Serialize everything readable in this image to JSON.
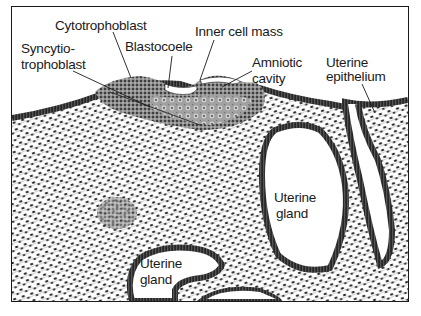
{
  "figure": {
    "labels": {
      "cytotrophoblast": "Cytotrophoblast",
      "blastocoele": "Blastocoele",
      "inner_cell_mass": "Inner cell mass",
      "syncytiotrophoblast_line1": "Syncytio-",
      "syncytiotrophoblast_line2": "trophoblast",
      "amniotic_cavity_line1": "Amniotic",
      "amniotic_cavity_line2": "cavity",
      "uterine_epithelium_line1": "Uterine",
      "uterine_epithelium_line2": "epithelium",
      "uterine_gland_center_line1": "Uterine",
      "uterine_gland_center_line2": "gland",
      "uterine_gland_lower_line1": "Uterine",
      "uterine_gland_lower_line2": "gland"
    },
    "colors": {
      "ink": "#1a1a1a",
      "tissue": "#d9d9d9",
      "epithelium": "#3a3a3a",
      "lumen": "#ffffff"
    }
  }
}
